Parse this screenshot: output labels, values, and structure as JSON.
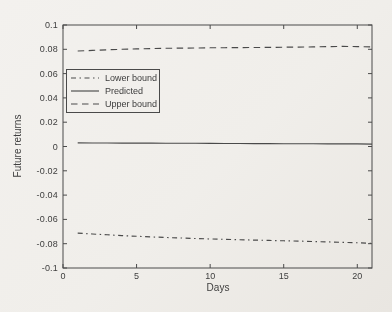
{
  "figure": {
    "background": "#efede9",
    "line_color": "#4a4a4a",
    "text_color": "#3e3e3e"
  },
  "chart_data": {
    "type": "line",
    "title": "",
    "xlabel": "Days",
    "ylabel": "Future returns",
    "xlim": [
      0,
      21
    ],
    "ylim": [
      -0.1,
      0.1
    ],
    "grid": false,
    "legend_position": "inside-upper-left",
    "xticks": [
      0,
      5,
      10,
      15,
      20
    ],
    "xtick_labels": [
      "0",
      "5",
      "10",
      "15",
      "20"
    ],
    "yticks": [
      0.1,
      0.08,
      0.06,
      0.04,
      0.02,
      0,
      -0.02,
      -0.04,
      -0.06,
      -0.08,
      -0.1
    ],
    "ytick_labels": [
      "0.1",
      "0.08",
      "0.06",
      "0.04",
      "0.02",
      "0",
      "-0.02",
      "-0.04",
      "-0.06",
      "-0.08",
      "-0.1"
    ],
    "x": [
      1,
      2,
      3,
      4,
      5,
      6,
      7,
      8,
      9,
      10,
      11,
      12,
      13,
      14,
      15,
      16,
      17,
      18,
      19,
      20,
      21
    ],
    "series": [
      {
        "name": "Lower bound",
        "style": "dashdot",
        "values": [
          -0.0713,
          -0.072,
          -0.0727,
          -0.0733,
          -0.0739,
          -0.0744,
          -0.0749,
          -0.0753,
          -0.0757,
          -0.0761,
          -0.0764,
          -0.0767,
          -0.077,
          -0.0773,
          -0.0776,
          -0.0779,
          -0.0782,
          -0.0785,
          -0.0789,
          -0.0793,
          -0.0797
        ]
      },
      {
        "name": "Predicted",
        "style": "solid",
        "values": [
          0.003,
          0.0029,
          0.0029,
          0.0028,
          0.0028,
          0.0028,
          0.0027,
          0.0027,
          0.0026,
          0.0026,
          0.0025,
          0.0025,
          0.0024,
          0.0024,
          0.0023,
          0.0023,
          0.0022,
          0.0022,
          0.0021,
          0.0021,
          0.002
        ]
      },
      {
        "name": "Upper bound",
        "style": "dashed",
        "values": [
          0.0786,
          0.0791,
          0.0796,
          0.08,
          0.0803,
          0.0806,
          0.0808,
          0.081,
          0.0811,
          0.0812,
          0.0813,
          0.0814,
          0.0815,
          0.0816,
          0.0817,
          0.0818,
          0.082,
          0.0822,
          0.0824,
          0.0822,
          0.0819
        ]
      }
    ]
  }
}
